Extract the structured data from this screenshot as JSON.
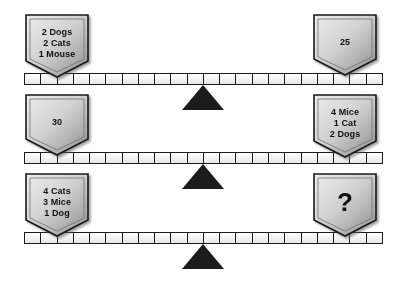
{
  "puzzle": {
    "title": "Animal balance scales puzzle",
    "colors": {
      "plaque_light": "#e9e9e9",
      "plaque_dark": "#8f8f8f",
      "outline": "#1a1a1a",
      "fulcrum": "#1b1b1b",
      "beam_fill": "#fdfdfd",
      "background": "#ffffff"
    },
    "beam_segments": 22,
    "icons": {
      "fulcrum": "triangle-fulcrum-icon",
      "plaque": "pentagon-plaque-icon"
    },
    "scales": [
      {
        "id": "scale-1",
        "left": {
          "lines": [
            "2 Dogs",
            "2 Cats",
            "1 Mouse"
          ]
        },
        "right": {
          "lines": [
            "25"
          ]
        }
      },
      {
        "id": "scale-2",
        "left": {
          "lines": [
            "30"
          ]
        },
        "right": {
          "lines": [
            "4 Mice",
            "1 Cat",
            "2 Dogs"
          ]
        }
      },
      {
        "id": "scale-3",
        "left": {
          "lines": [
            "4 Cats",
            "3 Mice",
            "1 Dog"
          ]
        },
        "right": {
          "lines": [
            "?"
          ]
        }
      }
    ]
  }
}
